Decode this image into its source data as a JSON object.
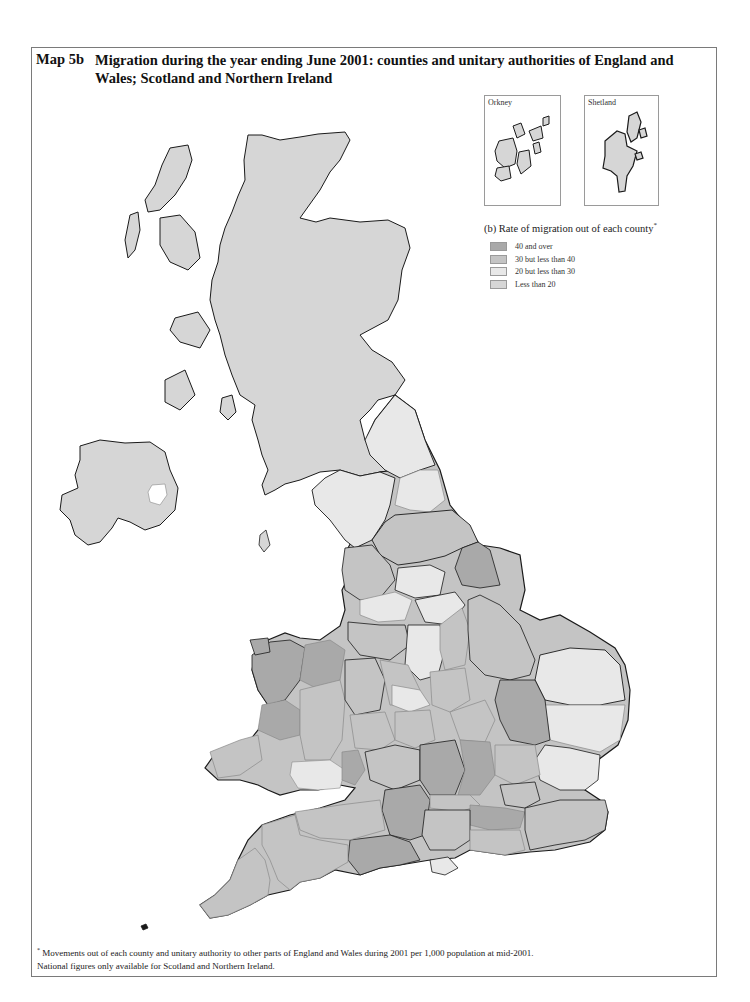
{
  "header": {
    "map_label": "Map 5b",
    "title": "Migration during the year ending June 2001: counties and unitary authorities of  England and Wales; Scotland and Northern Ireland"
  },
  "insets": [
    {
      "label": "Orkney"
    },
    {
      "label": "Shetland"
    }
  ],
  "legend": {
    "title": "(b) Rate of migration out of each county",
    "title_marker": "*",
    "items": [
      {
        "label": "40 and over",
        "color": "#a9a9a9"
      },
      {
        "label": "30 but less than 40",
        "color": "#c4c4c4"
      },
      {
        "label": "20 but less than 30",
        "color": "#e8e8e8"
      },
      {
        "label": "Less than 20",
        "color": "#d6d6d6"
      }
    ]
  },
  "regions": {
    "scotland": {
      "name": "Scotland",
      "class": "Less than 20"
    },
    "northern_ireland": {
      "name": "Northern Ireland",
      "class": "Less than 20"
    },
    "england_and_wales": {
      "name": "England and Wales",
      "note": "Shaded by county and unitary authority"
    }
  },
  "footnote": {
    "marker": "*",
    "line1": "Movements out of each county and unitary authority to other parts of England and Wales during 2001 per 1,000 population at mid-2001.",
    "line2": "National figures only available for Scotland and Northern Ireland."
  },
  "colors": {
    "band_40_plus": "#a9a9a9",
    "band_30_40": "#c4c4c4",
    "band_20_30": "#e8e8e8",
    "band_under_20": "#d6d6d6",
    "outline": "#1a1a1a",
    "inner_border": "#8a8a8a"
  }
}
